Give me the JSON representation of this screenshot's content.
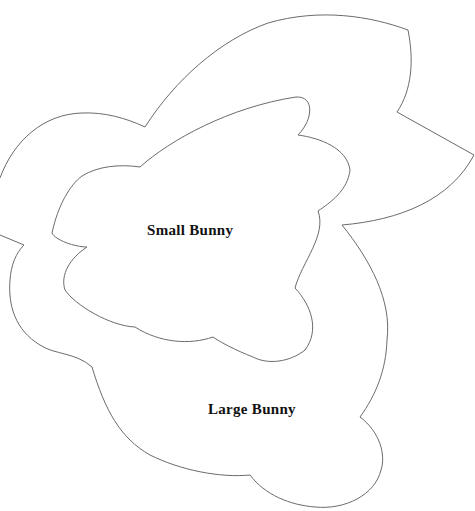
{
  "template": {
    "title": "Bunny Template",
    "shapes": [
      {
        "id": "large",
        "label": "Large Bunny"
      },
      {
        "id": "small",
        "label": "Small Bunny"
      }
    ],
    "stroke_color": "#6b6b6b",
    "text_color": "#111111",
    "background": "#ffffff"
  }
}
